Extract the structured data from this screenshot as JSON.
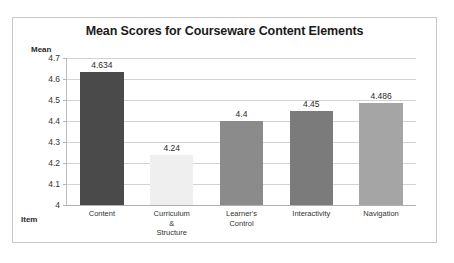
{
  "chart_data": {
    "type": "bar",
    "title": "Mean Scores for Courseware Content Elements",
    "xlabel": "Item",
    "ylabel": "Mean",
    "categories": [
      "Content",
      "Curriculum & Structure",
      "Learner's Control",
      "Interactivity",
      "Navigation"
    ],
    "category_lines": [
      [
        "Content"
      ],
      [
        "Curriculum &",
        "Structure"
      ],
      [
        "Learner's",
        "Control"
      ],
      [
        "Interactivity"
      ],
      [
        "Navigation"
      ]
    ],
    "values": [
      4.634,
      4.24,
      4.4,
      4.45,
      4.486
    ],
    "value_labels": [
      "4.634",
      "4.24",
      "4.4",
      "4.45",
      "4.486"
    ],
    "bar_colors": [
      "#4a4a4a",
      "#efefef",
      "#8b8b8b",
      "#7b7b7b",
      "#a5a5a5"
    ],
    "ylim": [
      4,
      4.7
    ],
    "yticks": [
      4,
      4.1,
      4.2,
      4.3,
      4.4,
      4.5,
      4.6,
      4.7
    ],
    "ytick_labels": [
      "4",
      "4.1",
      "4.2",
      "4.3",
      "4.4",
      "4.5",
      "4.6",
      "4.7"
    ],
    "grid": true,
    "legend": false,
    "legend_position": "none",
    "border_color": "#c8c8c8",
    "gridline_color": "#d2d2d2",
    "background": "#ffffff"
  }
}
